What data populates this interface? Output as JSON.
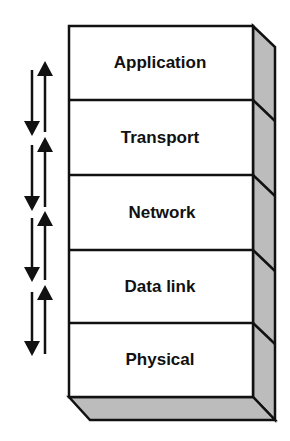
{
  "diagram": {
    "layers": [
      {
        "label": "Application"
      },
      {
        "label": "Transport"
      },
      {
        "label": "Network"
      },
      {
        "label": "Data link"
      },
      {
        "label": "Physical"
      }
    ],
    "arrows": [
      {
        "from": "Application",
        "to": "Transport",
        "direction": "bidirectional"
      },
      {
        "from": "Transport",
        "to": "Network",
        "direction": "bidirectional"
      },
      {
        "from": "Network",
        "to": "Data link",
        "direction": "bidirectional"
      },
      {
        "from": "Data link",
        "to": "Physical",
        "direction": "bidirectional"
      }
    ],
    "colors": {
      "front_face": "#ffffff",
      "side_face": "#bcbcbc",
      "outline": "#111111"
    }
  }
}
